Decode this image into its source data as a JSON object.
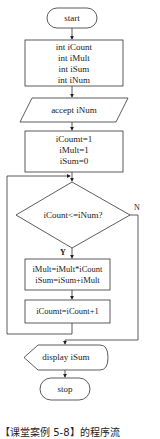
{
  "flowchart": {
    "start": "start",
    "declare": [
      "int iCount",
      "int iMult",
      "int iSum",
      "int iNum"
    ],
    "input": "accept iNum",
    "init": [
      "iCoumt=1",
      "iMult=1",
      "iSum=0"
    ],
    "decision": "iCount<=iNum?",
    "yes_label": "Y",
    "no_label": "N",
    "process": [
      "iMult=iMult*iCount",
      "iSum=iSum+iMult"
    ],
    "increment": "iCoumt=iCount+1",
    "output": "display iSum",
    "stop": "stop"
  },
  "caption": "【课堂案例 5-8】的程序流"
}
